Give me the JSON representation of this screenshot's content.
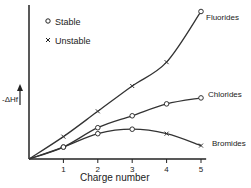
{
  "chart_data": {
    "type": "line",
    "title": "",
    "xlabel": "Charge number",
    "ylabel": "-ΔHf",
    "x": [
      1,
      2,
      3,
      4,
      5
    ],
    "xlim": [
      0,
      5.2
    ],
    "ylim": [
      0,
      10.5
    ],
    "grid": false,
    "legend": {
      "position": "upper-left",
      "entries": [
        {
          "marker": "circle",
          "label": "Stable"
        },
        {
          "marker": "cross",
          "label": "Unstable"
        }
      ]
    },
    "series": [
      {
        "name": "Fluorides",
        "values": [
          1.5,
          3.2,
          4.9,
          6.5,
          9.9
        ],
        "markers": [
          "cross",
          "cross",
          "cross",
          "cross",
          "circle"
        ]
      },
      {
        "name": "Chlorides",
        "values": [
          0.8,
          2.1,
          2.9,
          3.7,
          4.1
        ],
        "markers": [
          "circle",
          "circle",
          "circle",
          "circle",
          "circle"
        ]
      },
      {
        "name": "Bromides",
        "values": [
          0.8,
          1.7,
          2.0,
          1.7,
          0.9
        ],
        "markers": [
          "circle",
          "circle",
          "circle",
          "cross",
          "cross"
        ]
      }
    ]
  },
  "labels": {
    "ylabel": "-ΔHf",
    "xlabel": "Charge number",
    "legend_stable": "Stable",
    "legend_unstable": "Unstable",
    "ticks": [
      "1",
      "2",
      "3",
      "4",
      "5"
    ],
    "series_fluorides": "Fluorides",
    "series_chlorides": "Chlorides",
    "series_bromides": "Bromides"
  }
}
